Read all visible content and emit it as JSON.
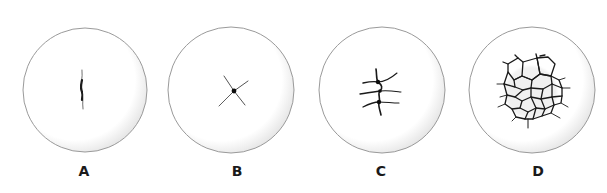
{
  "figure": {
    "panels": [
      {
        "id": "A",
        "label": "A",
        "cx": 85,
        "cy": 90,
        "r": 62,
        "pattern": "single-linear-crack"
      },
      {
        "id": "B",
        "label": "B",
        "cx": 231,
        "cy": 90,
        "r": 63,
        "pattern": "four-arm-star-crack"
      },
      {
        "id": "C",
        "label": "C",
        "cx": 382,
        "cy": 90,
        "r": 63,
        "pattern": "branched-crack"
      },
      {
        "id": "D",
        "label": "D",
        "cx": 532,
        "cy": 90,
        "r": 63,
        "pattern": "polygonal-crack-network"
      }
    ],
    "colors": {
      "outline": "#9a9a9a",
      "shading": "#e2e2e2",
      "crack": "#1a1a1a",
      "label": "#1a1a1a",
      "background": "#ffffff"
    }
  }
}
